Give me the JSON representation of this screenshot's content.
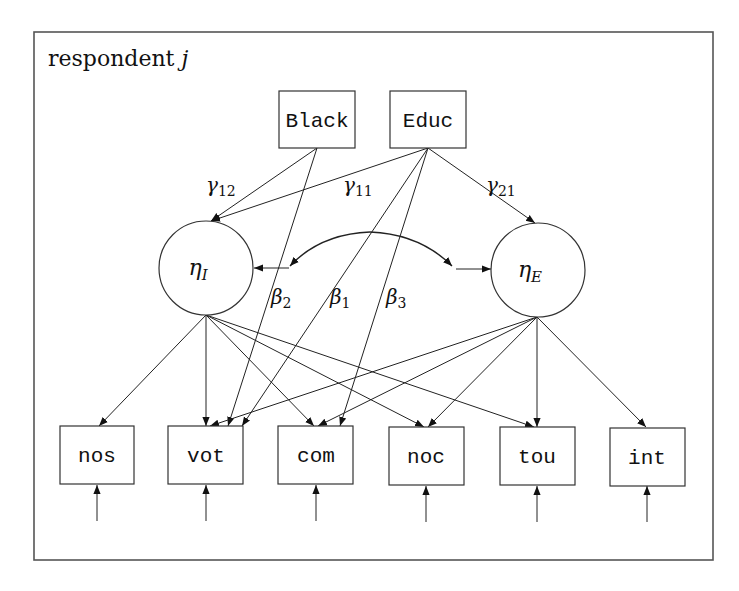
{
  "header": {
    "cut_off_caption": ""
  },
  "frame": {
    "label_text": "respondent",
    "label_var": "j"
  },
  "observed_covariates": [
    {
      "id": "black",
      "label": "Black"
    },
    {
      "id": "educ",
      "label": "Educ"
    }
  ],
  "latent_variables": [
    {
      "id": "eta_I",
      "symbol": "η",
      "subscript": "I"
    },
    {
      "id": "eta_E",
      "symbol": "η",
      "subscript": "E"
    }
  ],
  "indicators": [
    {
      "id": "nos",
      "label": "nos"
    },
    {
      "id": "vot",
      "label": "vot"
    },
    {
      "id": "com",
      "label": "com"
    },
    {
      "id": "noc",
      "label": "noc"
    },
    {
      "id": "tou",
      "label": "tou"
    },
    {
      "id": "int",
      "label": "int"
    }
  ],
  "path_labels": {
    "gamma12": {
      "symbol": "γ",
      "sub": "12"
    },
    "gamma11": {
      "symbol": "γ",
      "sub": "11"
    },
    "gamma21": {
      "symbol": "γ",
      "sub": "21"
    },
    "beta2": {
      "symbol": "β",
      "sub": "2"
    },
    "beta1": {
      "symbol": "β",
      "sub": "1"
    },
    "beta3": {
      "symbol": "β",
      "sub": "3"
    }
  },
  "paths": [
    {
      "from": "black",
      "to": "eta_I",
      "label": "gamma12"
    },
    {
      "from": "educ",
      "to": "eta_I",
      "label": "gamma11"
    },
    {
      "from": "educ",
      "to": "eta_E",
      "label": "gamma21"
    },
    {
      "from": "black",
      "to": "vot",
      "label": "beta2"
    },
    {
      "from": "educ",
      "to": "vot",
      "label": "beta1"
    },
    {
      "from": "educ",
      "to": "com",
      "label": "beta3"
    },
    {
      "from": "eta_I",
      "to": "nos"
    },
    {
      "from": "eta_I",
      "to": "vot"
    },
    {
      "from": "eta_I",
      "to": "com"
    },
    {
      "from": "eta_I",
      "to": "noc"
    },
    {
      "from": "eta_I",
      "to": "tou"
    },
    {
      "from": "eta_E",
      "to": "vot"
    },
    {
      "from": "eta_E",
      "to": "com"
    },
    {
      "from": "eta_E",
      "to": "noc"
    },
    {
      "from": "eta_E",
      "to": "tou"
    },
    {
      "from": "eta_E",
      "to": "int"
    }
  ],
  "covariances": [
    {
      "between": [
        "eta_I",
        "eta_E"
      ],
      "style": "curved-double-arrow"
    }
  ],
  "error_terms": [
    "nos",
    "vot",
    "com",
    "noc",
    "tou",
    "int"
  ]
}
